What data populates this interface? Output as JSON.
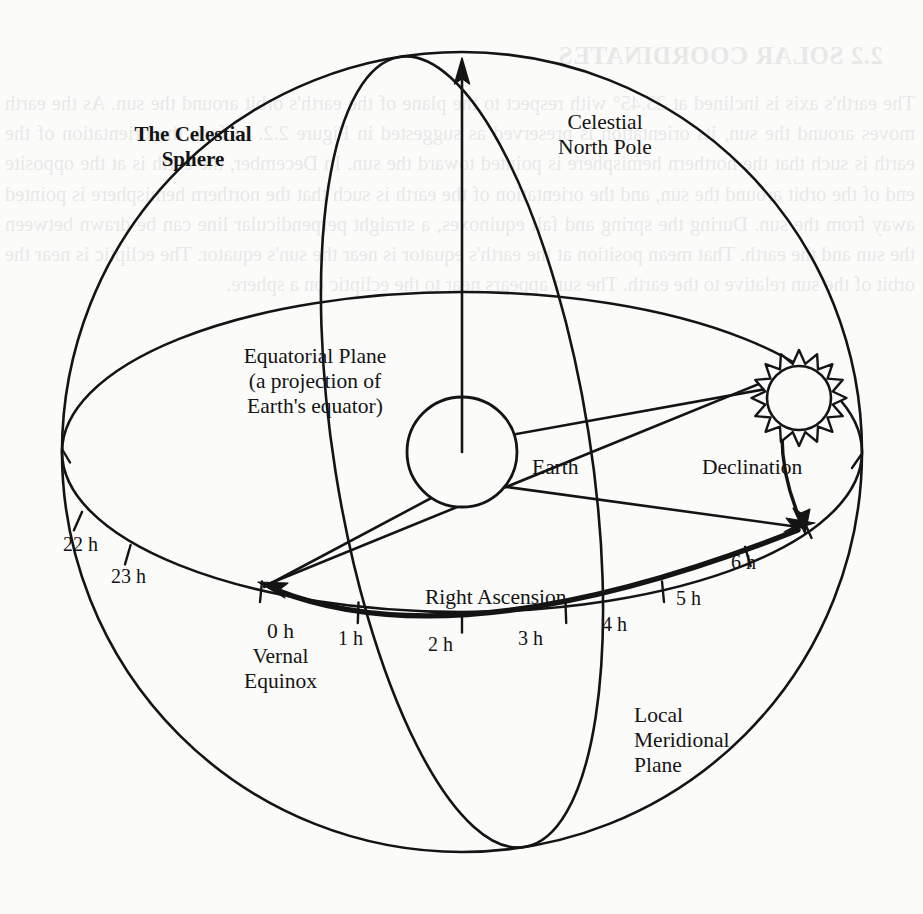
{
  "page": {
    "width": 923,
    "height": 914,
    "background_color": "#fbfbfa",
    "ink_color": "#141414"
  },
  "figure": {
    "type": "astronomical-diagram",
    "labels": {
      "celestial_sphere": "The Celestial\nSphere",
      "celestial_north_pole": "Celestial\nNorth Pole",
      "equatorial_plane": "Equatorial Plane\n(a projection of\nEarth's equator)",
      "earth": "Earth",
      "declination": "Declination",
      "right_ascension": "Right Ascension",
      "vernal_equinox": "0 h\nVernal\nEquinox",
      "local_meridional_plane": "Local\nMeridional\nPlane"
    },
    "hour_ticks": [
      {
        "label": "22 h",
        "x": 63,
        "y": 533
      },
      {
        "label": "23 h",
        "x": 111,
        "y": 565
      },
      {
        "label": "1 h",
        "x": 338,
        "y": 627
      },
      {
        "label": "2 h",
        "x": 428,
        "y": 633
      },
      {
        "label": "3 h",
        "x": 518,
        "y": 627
      },
      {
        "label": "4 h",
        "x": 602,
        "y": 613
      },
      {
        "label": "5 h",
        "x": 676,
        "y": 587
      },
      {
        "label": "6 h",
        "x": 731,
        "y": 551
      }
    ],
    "elements": [
      "outer-celestial-sphere-circle",
      "equatorial-plane-ellipse",
      "local-meridional-plane-ellipse",
      "polar-axis-arrow",
      "earth-globe",
      "sun-starburst",
      "right-ascension-arc-arrow",
      "declination-arc-arrow",
      "earth-to-sun-sightline",
      "earth-to-vernal-equinox-line",
      "earth-to-6h-line",
      "vernal-equinox-to-sun-line"
    ]
  },
  "bleedthrough": {
    "heading": "2.2  SOLAR COORDINATES",
    "body": "The earth's axis is inclined at 23.45° with respect to the plane of the earth's orbit around the sun. As the earth moves around the sun, its orientation is preserved as suggested in Figure 2.2. In fact, the orientation of the earth is such that the northern hemisphere is pointed toward the sun. In December, the earth is at the opposite end of the orbit around the sun, and the orientation of the earth is such that the northern hemisphere is pointed away from the sun. During the spring and fall equinoxes, a straight perpendicular line can be drawn between the sun and the earth. That mean position at the earth's equator is near the sun's equator. The ecliptic is near the orbit of the sun relative to the earth. The sun appears near to the ecliptic on a sphere."
  }
}
